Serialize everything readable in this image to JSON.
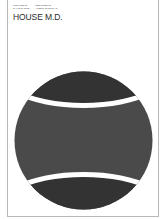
{
  "poster": {
    "credits": [
      "CREATED BY\nDAVID SHORE",
      "DESIGNED BY\nALBERT EXERGIAN"
    ],
    "title": "HOUSE M.D.",
    "colors": {
      "background": "#ffffff",
      "ball_body": "#4a4a4a",
      "ball_caps": "#333333",
      "seam": "#ffffff",
      "frame": "#b8b8b8"
    },
    "artwork": "tennis-ball-pill"
  }
}
